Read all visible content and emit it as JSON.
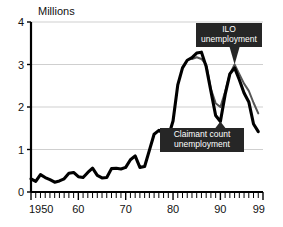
{
  "chart_data": {
    "type": "line",
    "title": "",
    "subtitle": "",
    "ylabel": "Millions",
    "xlabel": "",
    "ylim": [
      0,
      4
    ],
    "xlim": [
      1950,
      1999
    ],
    "grid": true,
    "gridlines_y": [
      1,
      2,
      3,
      4
    ],
    "legend_position": "annotations-in-plot",
    "y_ticks": [
      "0",
      "1",
      "2",
      "3",
      "4"
    ],
    "y_tick_values": [
      0,
      1,
      2,
      3,
      4
    ],
    "x_ticks": [
      "1950",
      "60",
      "70",
      "80",
      "90",
      "99"
    ],
    "x_tick_values": [
      1950,
      1960,
      1970,
      1980,
      1990,
      1999
    ],
    "x_minor_tick_interval": 1,
    "units": "Millions of people",
    "series": [
      {
        "name": "Claimant count unemployment",
        "color": "#000000",
        "style": "thick-solid",
        "x": [
          1950,
          1951,
          1952,
          1953,
          1954,
          1955,
          1956,
          1957,
          1958,
          1959,
          1960,
          1961,
          1962,
          1963,
          1964,
          1965,
          1966,
          1967,
          1968,
          1969,
          1970,
          1971,
          1972,
          1973,
          1974,
          1975,
          1976,
          1977,
          1978,
          1979,
          1980,
          1981,
          1982,
          1983,
          1984,
          1985,
          1986,
          1987,
          1988,
          1989,
          1990,
          1991,
          1992,
          1993,
          1994,
          1995,
          1996,
          1997,
          1998
        ],
        "values": [
          0.31,
          0.25,
          0.41,
          0.34,
          0.29,
          0.23,
          0.26,
          0.31,
          0.44,
          0.46,
          0.36,
          0.34,
          0.46,
          0.56,
          0.39,
          0.33,
          0.34,
          0.55,
          0.56,
          0.54,
          0.58,
          0.76,
          0.85,
          0.58,
          0.6,
          0.98,
          1.36,
          1.45,
          1.38,
          1.3,
          1.67,
          2.52,
          2.92,
          3.1,
          3.16,
          3.27,
          3.29,
          2.95,
          2.37,
          1.8,
          1.66,
          2.29,
          2.78,
          2.92,
          2.64,
          2.33,
          2.12,
          1.6,
          1.42
        ]
      },
      {
        "name": "ILO unemployment",
        "color": "#565656",
        "style": "thin-solid",
        "x": [
          1984,
          1985,
          1986,
          1987,
          1988,
          1989,
          1990,
          1991,
          1992,
          1993,
          1994,
          1995,
          1996,
          1997,
          1998
        ],
        "values": [
          3.13,
          3.17,
          3.13,
          3.0,
          2.42,
          2.09,
          2.0,
          2.36,
          2.78,
          3.0,
          2.77,
          2.55,
          2.38,
          2.1,
          1.85
        ]
      }
    ],
    "annotations": [
      {
        "name": "ilo-callout",
        "label": "ILO\nunemployment",
        "line1": "ILO",
        "line2": "unemployment",
        "points_to_year": 1993,
        "points_to_value": 3.0,
        "box_color": "#262626",
        "text_color": "#ffffff"
      },
      {
        "name": "claimant-callout",
        "label": "Claimant count\nunemployment",
        "line1": "Claimant count",
        "line2": "unemployment",
        "points_to_year": 1990,
        "points_to_value": 1.66,
        "box_color": "#262626",
        "text_color": "#ffffff"
      }
    ]
  },
  "axis": {
    "y_title": "Millions",
    "y_tick_0": "0",
    "y_tick_1": "1",
    "y_tick_2": "2",
    "y_tick_3": "3",
    "y_tick_4": "4",
    "x_tick_0": "1950",
    "x_tick_1": "60",
    "x_tick_2": "70",
    "x_tick_3": "80",
    "x_tick_4": "90",
    "x_tick_5": "99"
  },
  "annotations": {
    "ilo": {
      "line1": "ILO",
      "line2": "unemployment"
    },
    "claimant": {
      "line1": "Claimant count",
      "line2": "unemployment"
    }
  },
  "colors": {
    "claimant_line": "#000000",
    "ilo_line": "#565656",
    "callout_bg": "#262626",
    "callout_fg": "#ffffff",
    "grid": "#c9c9c9",
    "background": "#ffffff"
  }
}
